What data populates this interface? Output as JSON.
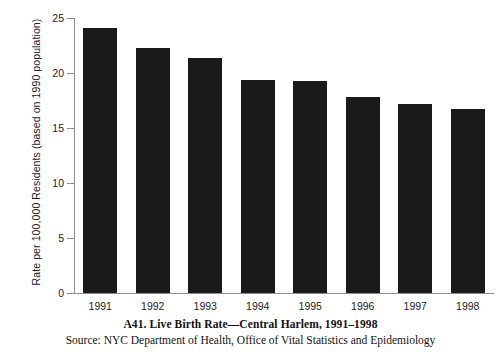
{
  "chart_data": {
    "type": "bar",
    "title": "A41. Live Birth Rate—Central Harlem, 1991–1998",
    "source": "Source: NYC Department of Health, Office of Vital Statistics and Epidemiology",
    "xlabel": "",
    "ylabel": "Rate per 100,000 Residents (based on 1990 population)",
    "categories": [
      "1991",
      "1992",
      "1993",
      "1994",
      "1995",
      "1996",
      "1997",
      "1998"
    ],
    "values": [
      24.1,
      22.3,
      21.4,
      19.4,
      19.3,
      17.8,
      17.2,
      16.7
    ],
    "ylim": [
      0,
      25
    ],
    "yticks": [
      "0",
      "5",
      "10",
      "15",
      "20",
      "25"
    ],
    "ytick_values": [
      0,
      5,
      10,
      15,
      20,
      25
    ],
    "grid": false,
    "legend": null,
    "bar_color": "#1a1a1a",
    "axis_color": "#8d8d8d",
    "background": "#ffffff"
  }
}
